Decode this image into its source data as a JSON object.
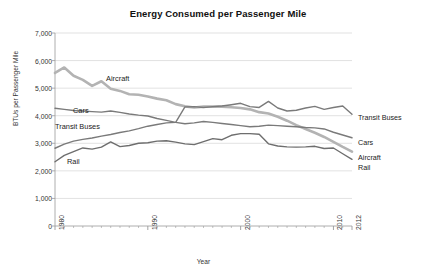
{
  "chart_data": {
    "type": "line",
    "title": "Energy Consumed per Passenger Mile",
    "xlabel": "Year",
    "ylabel": "BTUs per Passenger Mile",
    "ylim": [
      0,
      7000
    ],
    "xlim": [
      1980,
      2012
    ],
    "ytick_labels": [
      "7,000",
      "6,000",
      "5,000",
      "4,000",
      "3,000",
      "2,000",
      "1,000",
      "0"
    ],
    "ytick_values": [
      7000,
      6000,
      5000,
      4000,
      3000,
      2000,
      1000,
      0
    ],
    "xtick_labels": [
      "1980",
      "1990",
      "2000",
      "2010",
      "2012"
    ],
    "xtick_values": [
      1980,
      1990,
      2000,
      2010,
      2012
    ],
    "grid": "horizontal",
    "legend_position": "inline-and-right-of-plot",
    "x": [
      1980,
      1981,
      1982,
      1983,
      1984,
      1985,
      1986,
      1987,
      1988,
      1989,
      1990,
      1991,
      1992,
      1993,
      1994,
      1995,
      1996,
      1997,
      1998,
      1999,
      2000,
      2001,
      2002,
      2003,
      2004,
      2005,
      2006,
      2007,
      2008,
      2009,
      2010,
      2011,
      2012
    ],
    "series": [
      {
        "name": "Aircraft",
        "color": "#b3b3b3",
        "width": 2.6,
        "values": [
          5550,
          5750,
          5450,
          5300,
          5080,
          5250,
          4980,
          4900,
          4780,
          4760,
          4700,
          4620,
          4560,
          4420,
          4340,
          4300,
          4330,
          4330,
          4330,
          4310,
          4280,
          4230,
          4130,
          4080,
          3960,
          3820,
          3660,
          3520,
          3380,
          3230,
          3050,
          2870,
          2700
        ]
      },
      {
        "name": "Cars",
        "color": "#7a7a7a",
        "width": 1.4,
        "values": [
          4270,
          4230,
          4190,
          4170,
          4150,
          4130,
          4170,
          4120,
          4060,
          4020,
          3990,
          3900,
          3830,
          3760,
          3710,
          3740,
          3790,
          3760,
          3720,
          3680,
          3640,
          3600,
          3620,
          3660,
          3640,
          3620,
          3600,
          3570,
          3560,
          3520,
          3400,
          3300,
          3200
        ]
      },
      {
        "name": "Transit Buses",
        "color": "#7a7a7a",
        "width": 1.4,
        "values": [
          2820,
          2970,
          3080,
          3140,
          3190,
          3260,
          3320,
          3390,
          3450,
          3530,
          3620,
          3680,
          3740,
          3760,
          4320,
          4330,
          4300,
          4330,
          4350,
          4400,
          4450,
          4330,
          4300,
          4520,
          4280,
          4170,
          4200,
          4280,
          4340,
          4230,
          4300,
          4350,
          4050
        ]
      },
      {
        "name": "Rail",
        "color": "#6e6e6e",
        "width": 1.4,
        "values": [
          2330,
          2560,
          2700,
          2830,
          2790,
          2860,
          3050,
          2880,
          2920,
          3000,
          3020,
          3080,
          3090,
          3040,
          2980,
          2950,
          3060,
          3170,
          3130,
          3290,
          3350,
          3350,
          3330,
          2980,
          2900,
          2870,
          2860,
          2870,
          2890,
          2810,
          2830,
          2620,
          2420
        ]
      }
    ],
    "inline_annotations": [
      {
        "label": "Aircraft",
        "x_px": 106,
        "y_px": 74
      },
      {
        "label": "Cars",
        "x_px": 73,
        "y_px": 106
      },
      {
        "label": "Transit Buses",
        "x_px": 55,
        "y_px": 122
      },
      {
        "label": "Rail",
        "x_px": 67,
        "y_px": 157
      }
    ],
    "end_labels": [
      {
        "label": "Transit Buses",
        "x_px": 358,
        "y_px": 113
      },
      {
        "label": "Cars",
        "x_px": 358,
        "y_px": 138
      },
      {
        "label": "Aircraft",
        "x_px": 358,
        "y_px": 153
      },
      {
        "label": "Rail",
        "x_px": 358,
        "y_px": 163
      }
    ],
    "plot_area_px": {
      "left": 55,
      "right": 352,
      "top": 33,
      "bottom": 226
    },
    "colors": {
      "background": "#ffffff",
      "grid": "#d4d4d4",
      "axis": "#9a9a9a",
      "text": "#222222"
    }
  }
}
